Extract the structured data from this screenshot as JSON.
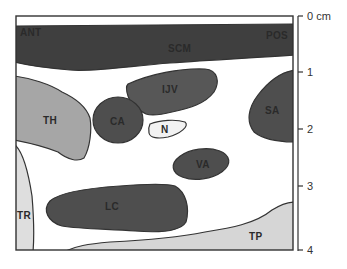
{
  "diagram": {
    "type": "ultrasound-cross-section",
    "orientation": {
      "left": "ANT",
      "right": "POS"
    },
    "structures": [
      {
        "id": "SCM",
        "label": "SCM",
        "shade": "#3f3f3f"
      },
      {
        "id": "IJV",
        "label": "IJV",
        "shade": "#575757"
      },
      {
        "id": "CA",
        "label": "CA",
        "shade": "#4e4e4e"
      },
      {
        "id": "N",
        "label": "N",
        "shade": "#f2f2f2"
      },
      {
        "id": "SA",
        "label": "SA",
        "shade": "#4e4e4e"
      },
      {
        "id": "TH",
        "label": "TH",
        "shade": "#a6a6a6"
      },
      {
        "id": "VA",
        "label": "VA",
        "shade": "#4e4e4e"
      },
      {
        "id": "LC",
        "label": "LC",
        "shade": "#4e4e4e"
      },
      {
        "id": "TR",
        "label": "TR",
        "shade": "#dedede"
      },
      {
        "id": "TP",
        "label": "TP",
        "shade": "#d6d6d6"
      }
    ],
    "scale": {
      "unit": "cm",
      "ticks": [
        {
          "value": "0 cm",
          "y": 16
        },
        {
          "value": "1",
          "y": 72
        },
        {
          "value": "2",
          "y": 129
        },
        {
          "value": "3",
          "y": 186
        },
        {
          "value": "4",
          "y": 250
        }
      ]
    },
    "colors": {
      "outline": "#333333",
      "background": "#ffffff"
    }
  }
}
